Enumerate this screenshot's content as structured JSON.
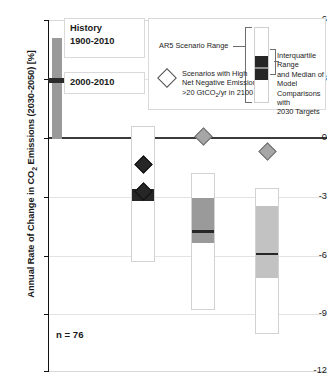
{
  "axis": {
    "ylabel_pre": "Annual Rate of Change in CO",
    "ylabel_sub": "2",
    "ylabel_post": " Emissions (2030-2050) [%]",
    "ticks": [
      "6",
      "3",
      "0",
      "-3",
      "-6",
      "-9",
      "-12"
    ]
  },
  "history": {
    "title_line1": "History",
    "title_line2": "1900-2010",
    "marker_label": "2000-2010"
  },
  "legend": {
    "ar5_range": "AR5 Scenario Range",
    "scenarios_line1": "Scenarios with High",
    "scenarios_line2": "Net Negative Emissions",
    "scenarios_line3_pre": ">20 GtCO",
    "scenarios_line3_sub": "2",
    "scenarios_line3_post": "/yr in 2100",
    "iqr_line1": "Interquartile Range",
    "iqr_line2": "and Median of Model",
    "iqr_line3": "Comparisons with",
    "iqr_line4": "2030 Targets"
  },
  "annotation": {
    "n_label": "n = 76"
  },
  "colors": {
    "dark": "#262626",
    "mid_gray": "#9a9a9a",
    "light_gray": "#c2c2c2",
    "axis": "#111111",
    "grid": "#e3e3e3",
    "box_outline": "#d2d2d2"
  },
  "chart_data": {
    "type": "bar",
    "title": "",
    "xlabel": "",
    "ylabel": "Annual Rate of Change in CO2 Emissions (2030-2050) [%]",
    "ylim": [
      -12,
      6
    ],
    "yticks": [
      6,
      3,
      0,
      -3,
      -6,
      -9,
      -12
    ],
    "grid": true,
    "legend_position": "top-right",
    "n": 76,
    "history_bar": {
      "label": "History 1900-2010",
      "range_low": 0.0,
      "range_high": 5.1,
      "marker_label": "2000-2010",
      "marker_value": 3.0
    },
    "groups": [
      {
        "name": "Group 1",
        "ar5_range_high": 0.55,
        "ar5_range_low": -6.3,
        "iqr_high": -2.6,
        "iqr_low": -3.1,
        "median": -3.15,
        "iqr_shade": "dark",
        "diamonds": [
          {
            "value": -1.35,
            "style": "dark"
          },
          {
            "value": -2.75,
            "style": "dark"
          }
        ]
      },
      {
        "name": "Group 2",
        "ar5_range_high": -1.85,
        "ar5_range_low": -8.75,
        "iqr_high": -3.1,
        "iqr_low": -5.4,
        "median": -4.8,
        "iqr_shade": "mid",
        "diamonds": [
          {
            "value": 0.1,
            "style": "gray"
          }
        ]
      },
      {
        "name": "Group 3",
        "ar5_range_high": -2.6,
        "ar5_range_low": -10.0,
        "iqr_high": -3.5,
        "iqr_low": -7.2,
        "median": -5.95,
        "iqr_shade": "light",
        "diamonds": [
          {
            "value": -0.7,
            "style": "gray"
          }
        ]
      }
    ]
  }
}
